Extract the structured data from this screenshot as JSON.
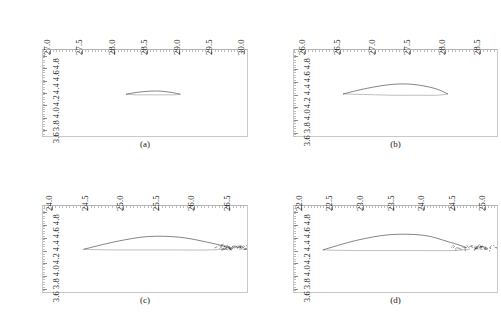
{
  "figure": {
    "axis_exponent_label": "(×10⁻³ m)",
    "y_axis_title": "(×10⁻³ m)",
    "line_color": "#333333",
    "frame_color": "#c9c9c9",
    "background": "#ffffff"
  },
  "chart_data": {
    "type": "line",
    "title": "",
    "xlabel": "(×10⁻³ m)",
    "ylabel": "(×10⁻³ m)",
    "grid": false,
    "legend": "none",
    "panels": [
      {
        "id": "a",
        "caption": "(a)",
        "xlim": [
          26.9,
          30.05
        ],
        "ylim": [
          4.9,
          3.5
        ],
        "xticks": [
          "27.0",
          "27.5",
          "28.0",
          "28.5",
          "29.0",
          "29.5",
          "30.0"
        ],
        "xtick_values": [
          27.0,
          27.5,
          28.0,
          28.5,
          29.0,
          29.5,
          30.0
        ],
        "yticks": [
          "3.4",
          "3.6",
          "3.8",
          "4.0",
          "4.2",
          "4.4",
          "4.6",
          "4.8"
        ],
        "ytick_values": [
          3.4,
          3.6,
          3.8,
          4.0,
          4.2,
          4.4,
          4.6,
          4.8
        ],
        "series": [
          {
            "name": "upper-branch",
            "x": [
              28.18,
              28.35,
              28.55,
              28.75,
              28.92,
              29.02
            ],
            "y": [
              4.18,
              4.17,
              4.17,
              4.17,
              4.17,
              4.18
            ]
          },
          {
            "name": "lower-branch",
            "x": [
              28.18,
              28.35,
              28.55,
              28.72,
              28.88,
              29.02
            ],
            "y": [
              4.18,
              4.21,
              4.23,
              4.23,
              4.21,
              4.18
            ]
          }
        ],
        "cluster": {
          "present": false,
          "x": 29.02,
          "y": 4.18,
          "spread": 0.0
        }
      },
      {
        "id": "b",
        "caption": "(b)",
        "xlim": [
          25.85,
          28.75
        ],
        "ylim": [
          4.9,
          3.55
        ],
        "xticks": [
          "26.0",
          "26.5",
          "27.0",
          "27.5",
          "28.0",
          "28.5"
        ],
        "xtick_values": [
          26.0,
          26.5,
          27.0,
          27.5,
          28.0,
          28.5
        ],
        "yticks": [
          "3.6",
          "3.8",
          "4.0",
          "4.2",
          "4.4",
          "4.6",
          "4.8"
        ],
        "ytick_values": [
          3.6,
          3.8,
          4.0,
          4.2,
          4.4,
          4.6,
          4.8
        ],
        "series": [
          {
            "name": "upper-branch",
            "x": [
              26.55,
              26.9,
              27.25,
              27.6,
              27.9,
              28.05
            ],
            "y": [
              4.21,
              4.2,
              4.19,
              4.19,
              4.19,
              4.21
            ]
          },
          {
            "name": "lower-branch",
            "x": [
              26.55,
              26.9,
              27.25,
              27.55,
              27.85,
              28.05
            ],
            "y": [
              4.21,
              4.3,
              4.36,
              4.36,
              4.3,
              4.21
            ]
          }
        ],
        "cluster": {
          "present": false,
          "x": 28.05,
          "y": 4.21,
          "spread": 0.0
        }
      },
      {
        "id": "c",
        "caption": "(c)",
        "xlim": [
          23.88,
          26.75
        ],
        "ylim": [
          4.9,
          3.55
        ],
        "xticks": [
          "24.0",
          "24.5",
          "25.0",
          "25.5",
          "26.0",
          "26.5"
        ],
        "xtick_values": [
          24.0,
          24.5,
          25.0,
          25.5,
          26.0,
          26.5
        ],
        "yticks": [
          "3.6",
          "3.8",
          "4.0",
          "4.2",
          "4.4",
          "4.6",
          "4.8"
        ],
        "ytick_values": [
          3.6,
          3.8,
          4.0,
          4.2,
          4.4,
          4.6,
          4.8
        ],
        "series": [
          {
            "name": "upper-branch",
            "x": [
              24.45,
              24.9,
              25.35,
              25.8,
              26.2,
              26.55
            ],
            "y": [
              4.22,
              4.21,
              4.21,
              4.21,
              4.21,
              4.23
            ]
          },
          {
            "name": "lower-branch",
            "x": [
              24.45,
              24.9,
              25.35,
              25.8,
              26.2,
              26.5
            ],
            "y": [
              4.22,
              4.34,
              4.42,
              4.41,
              4.33,
              4.25
            ]
          }
        ],
        "cluster": {
          "present": true,
          "x": 26.42,
          "y": 4.25,
          "spread": 0.22
        }
      },
      {
        "id": "d",
        "caption": "(d)",
        "xlim": [
          21.88,
          25.2
        ],
        "ylim": [
          4.9,
          3.55
        ],
        "xticks": [
          "22.0",
          "22.5",
          "23.0",
          "23.5",
          "24.0",
          "24.5",
          "25.0"
        ],
        "xtick_values": [
          22.0,
          22.5,
          23.0,
          23.5,
          24.0,
          24.5,
          25.0
        ],
        "yticks": [
          "3.6",
          "3.8",
          "4.0",
          "4.2",
          "4.4",
          "4.6",
          "4.8"
        ],
        "ytick_values": [
          3.6,
          3.8,
          4.0,
          4.2,
          4.4,
          4.6,
          4.8
        ],
        "series": [
          {
            "name": "upper-branch",
            "x": [
              22.35,
              22.9,
              23.45,
              24.0,
              24.45,
              24.75
            ],
            "y": [
              4.21,
              4.2,
              4.2,
              4.2,
              4.2,
              4.22
            ]
          },
          {
            "name": "lower-branch",
            "x": [
              22.35,
              22.9,
              23.45,
              24.0,
              24.4,
              24.7
            ],
            "y": [
              4.21,
              4.36,
              4.45,
              4.44,
              4.34,
              4.25
            ]
          }
        ],
        "cluster": {
          "present": true,
          "x": 24.6,
          "y": 4.24,
          "spread": 0.45
        }
      }
    ]
  }
}
